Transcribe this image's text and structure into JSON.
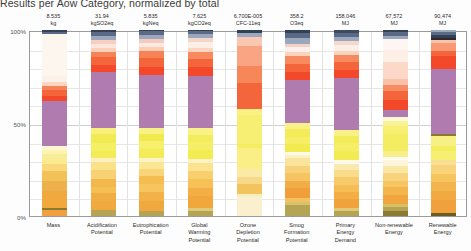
{
  "caption": "Results per Aow Category, normalized by total",
  "axis": {
    "y_ticks": [
      "100%",
      "50%",
      "0%"
    ],
    "y_values": [
      100,
      50,
      0
    ]
  },
  "chart_data": {
    "type": "bar",
    "subtype": "stacked-100-percent",
    "title": "Results per Aow Category, normalized by total",
    "xlabel": "",
    "ylabel": "",
    "ylim": [
      0,
      100
    ],
    "grid": true,
    "legend": "none",
    "categories": [
      "Mass",
      "Acidification Potential",
      "Eutrophication Potential",
      "Global Warming Potential",
      "Ozone Depletion Potential",
      "Smog Formation Potential",
      "Primary Energy Demand",
      "Non-renewable Energy",
      "Renewable Energy"
    ],
    "category_totals": [
      {
        "value": "8.535",
        "unit": "kg"
      },
      {
        "value": "31.94",
        "unit": "kgSO2eq"
      },
      {
        "value": "5.835",
        "unit": "kgNeq"
      },
      {
        "value": "7.625",
        "unit": "kgCO2eq"
      },
      {
        "value": "6.700E-005",
        "unit": "CFC-11eq"
      },
      {
        "value": "358.2",
        "unit": "O3eq"
      },
      {
        "value": "158,046",
        "unit": "MJ"
      },
      {
        "value": "67,572",
        "unit": "MJ"
      },
      {
        "value": "90,474",
        "unit": "MJ"
      }
    ],
    "stacks": [
      {
        "category": "Mass",
        "segments": [
          {
            "color": "#f0a03c",
            "pct": 3.0
          },
          {
            "color": "#8c7a33",
            "pct": 1.4
          },
          {
            "color": "#f3a83e",
            "pct": 4.0
          },
          {
            "color": "#f0a93f",
            "pct": 5.0
          },
          {
            "color": "#eeb04a",
            "pct": 5.5
          },
          {
            "color": "#f2c158",
            "pct": 5.0
          },
          {
            "color": "#f7d87a",
            "pct": 4.0
          },
          {
            "color": "#fbe98f",
            "pct": 2.0
          },
          {
            "color": "#f9ec96",
            "pct": 3.0
          },
          {
            "color": "#fdf3b2",
            "pct": 2.5
          },
          {
            "color": "#fdf7d0",
            "pct": 2.0
          },
          {
            "color": "#b07cb0",
            "pct": 24.0
          },
          {
            "color": "#f4482a",
            "pct": 2.4
          },
          {
            "color": "#f5653c",
            "pct": 3.6
          },
          {
            "color": "#f68355",
            "pct": 1.8
          },
          {
            "color": "#fbd7c3",
            "pct": 2.0
          },
          {
            "color": "#fdf0e6",
            "pct": 3.2
          },
          {
            "color": "#fdf6ef",
            "pct": 22.6
          },
          {
            "color": "#5a6a86",
            "pct": 1.0
          },
          {
            "color": "#334055",
            "pct": 1.0
          }
        ]
      },
      {
        "category": "Acidification Potential",
        "segments": [
          {
            "color": "#b5a453",
            "pct": 3.0
          },
          {
            "color": "#efa93e",
            "pct": 5.0
          },
          {
            "color": "#f0ad44",
            "pct": 4.0
          },
          {
            "color": "#f5bf52",
            "pct": 3.0
          },
          {
            "color": "#f3b84d",
            "pct": 4.5
          },
          {
            "color": "#f8d172",
            "pct": 4.5
          },
          {
            "color": "#fae18a",
            "pct": 4.0
          },
          {
            "color": "#fdf0c0",
            "pct": 2.0
          },
          {
            "color": "#f3ec56",
            "pct": 4.0
          },
          {
            "color": "#f5ef64",
            "pct": 4.0
          },
          {
            "color": "#f2ea52",
            "pct": 4.5
          },
          {
            "color": "#f7f07a",
            "pct": 3.5
          },
          {
            "color": "#b07cb0",
            "pct": 29.0
          },
          {
            "color": "#f4482a",
            "pct": 3.5
          },
          {
            "color": "#f5653c",
            "pct": 4.0
          },
          {
            "color": "#f68355",
            "pct": 3.0
          },
          {
            "color": "#fbd0bb",
            "pct": 2.0
          },
          {
            "color": "#fde7dd",
            "pct": 2.2
          },
          {
            "color": "#f6cfc2",
            "pct": 2.0
          },
          {
            "color": "#9aa7bd",
            "pct": 1.8
          },
          {
            "color": "#5a6a86",
            "pct": 2.2
          },
          {
            "color": "#334055",
            "pct": 1.0
          }
        ]
      },
      {
        "category": "Eutrophication Potential",
        "segments": [
          {
            "color": "#b5a453",
            "pct": 2.5
          },
          {
            "color": "#efa93e",
            "pct": 5.5
          },
          {
            "color": "#f2b247",
            "pct": 4.5
          },
          {
            "color": "#f6c55d",
            "pct": 4.0
          },
          {
            "color": "#f5bd50",
            "pct": 4.0
          },
          {
            "color": "#f9d478",
            "pct": 4.0
          },
          {
            "color": "#fbe693",
            "pct": 3.5
          },
          {
            "color": "#fdf3c8",
            "pct": 2.0
          },
          {
            "color": "#f3ec56",
            "pct": 4.5
          },
          {
            "color": "#f6f06c",
            "pct": 4.0
          },
          {
            "color": "#f1e94e",
            "pct": 4.0
          },
          {
            "color": "#f8f184",
            "pct": 3.0
          },
          {
            "color": "#b07cb0",
            "pct": 27.5
          },
          {
            "color": "#f4482a",
            "pct": 4.0
          },
          {
            "color": "#f5653c",
            "pct": 4.5
          },
          {
            "color": "#f68355",
            "pct": 3.5
          },
          {
            "color": "#fbcdb6",
            "pct": 2.2
          },
          {
            "color": "#fde9df",
            "pct": 2.3
          },
          {
            "color": "#f3cabc",
            "pct": 2.0
          },
          {
            "color": "#9aa7bd",
            "pct": 2.0
          },
          {
            "color": "#5a6a86",
            "pct": 2.0
          },
          {
            "color": "#334055",
            "pct": 0.5
          }
        ]
      },
      {
        "category": "Global Warming Potential",
        "segments": [
          {
            "color": "#b5a453",
            "pct": 2.5
          },
          {
            "color": "#dfc97a",
            "pct": 1.5
          },
          {
            "color": "#f2a73d",
            "pct": 6.0
          },
          {
            "color": "#f3ae45",
            "pct": 4.0
          },
          {
            "color": "#f6c258",
            "pct": 4.5
          },
          {
            "color": "#f8cf6d",
            "pct": 4.0
          },
          {
            "color": "#fbe391",
            "pct": 4.0
          },
          {
            "color": "#fdf2c6",
            "pct": 2.0
          },
          {
            "color": "#f2eb52",
            "pct": 4.5
          },
          {
            "color": "#f5ef68",
            "pct": 4.0
          },
          {
            "color": "#f3ec5c",
            "pct": 4.0
          },
          {
            "color": "#f8f288",
            "pct": 3.5
          },
          {
            "color": "#b07cb0",
            "pct": 26.0
          },
          {
            "color": "#f4482a",
            "pct": 4.5
          },
          {
            "color": "#f5653c",
            "pct": 4.0
          },
          {
            "color": "#f78a5e",
            "pct": 3.5
          },
          {
            "color": "#fbd5c2",
            "pct": 2.0
          },
          {
            "color": "#fdeee7",
            "pct": 3.0
          },
          {
            "color": "#f1d6cc",
            "pct": 2.0
          },
          {
            "color": "#9aa7bd",
            "pct": 2.0
          },
          {
            "color": "#5a6a86",
            "pct": 1.5
          },
          {
            "color": "#334055",
            "pct": 0.5
          }
        ]
      },
      {
        "category": "Ozone Depletion Potential",
        "segments": [
          {
            "color": "#fbf0cd",
            "pct": 10.0
          },
          {
            "color": "#f6f0c0",
            "pct": 2.0
          },
          {
            "color": "#f3c35e",
            "pct": 5.0
          },
          {
            "color": "#f8d98a",
            "pct": 4.0
          },
          {
            "color": "#fbe9a8",
            "pct": 4.5
          },
          {
            "color": "#f9ef86",
            "pct": 11.0
          },
          {
            "color": "#f5ec62",
            "pct": 2.0
          },
          {
            "color": "#f7ee74",
            "pct": 16.0
          },
          {
            "color": "#f9f184",
            "pct": 3.0
          },
          {
            "color": "#f5653c",
            "pct": 14.0
          },
          {
            "color": "#f78659",
            "pct": 9.0
          },
          {
            "color": "#f9a483",
            "pct": 11.0
          },
          {
            "color": "#fac7b2",
            "pct": 5.0
          },
          {
            "color": "#9aa7bd",
            "pct": 2.0
          },
          {
            "color": "#334055",
            "pct": 1.5
          }
        ]
      },
      {
        "category": "Smog Formation Potential",
        "segments": [
          {
            "color": "#b5a453",
            "pct": 6.0
          },
          {
            "color": "#d8c169",
            "pct": 1.5
          },
          {
            "color": "#f3c164",
            "pct": 2.0
          },
          {
            "color": "#f09f3a",
            "pct": 5.5
          },
          {
            "color": "#f2ae46",
            "pct": 4.0
          },
          {
            "color": "#f6c463",
            "pct": 4.0
          },
          {
            "color": "#f8d27a",
            "pct": 4.0
          },
          {
            "color": "#fae49c",
            "pct": 4.0
          },
          {
            "color": "#fcf0c6",
            "pct": 2.0
          },
          {
            "color": "#fefaea",
            "pct": 1.5
          },
          {
            "color": "#f2eb50",
            "pct": 4.0
          },
          {
            "color": "#f5ee66",
            "pct": 4.0
          },
          {
            "color": "#f3ec58",
            "pct": 4.5
          },
          {
            "color": "#f8f188",
            "pct": 3.0
          },
          {
            "color": "#b07cb0",
            "pct": 23.0
          },
          {
            "color": "#f4482a",
            "pct": 4.5
          },
          {
            "color": "#f5653c",
            "pct": 4.5
          },
          {
            "color": "#f78a5e",
            "pct": 4.0
          },
          {
            "color": "#fbd4c0",
            "pct": 2.0
          },
          {
            "color": "#fdf0e9",
            "pct": 3.0
          },
          {
            "color": "#f0d2c8",
            "pct": 1.5
          },
          {
            "color": "#9aa7bd",
            "pct": 3.0
          },
          {
            "color": "#5a6a86",
            "pct": 3.0
          },
          {
            "color": "#334055",
            "pct": 1.5
          }
        ]
      },
      {
        "category": "Primary Energy Demand",
        "segments": [
          {
            "color": "#b5a453",
            "pct": 2.5
          },
          {
            "color": "#e0c978",
            "pct": 1.5
          },
          {
            "color": "#f2a23b",
            "pct": 5.0
          },
          {
            "color": "#f3ae46",
            "pct": 3.5
          },
          {
            "color": "#f5bd54",
            "pct": 3.5
          },
          {
            "color": "#f7cb6b",
            "pct": 4.0
          },
          {
            "color": "#f9dd8b",
            "pct": 4.0
          },
          {
            "color": "#fbeab0",
            "pct": 3.0
          },
          {
            "color": "#fefae8",
            "pct": 2.0
          },
          {
            "color": "#f2eb52",
            "pct": 4.5
          },
          {
            "color": "#f5ee66",
            "pct": 4.0
          },
          {
            "color": "#f3ec5a",
            "pct": 4.0
          },
          {
            "color": "#f8f186",
            "pct": 3.0
          },
          {
            "color": "#b07cb0",
            "pct": 26.5
          },
          {
            "color": "#f4482a",
            "pct": 4.5
          },
          {
            "color": "#f5653c",
            "pct": 4.0
          },
          {
            "color": "#f78a5e",
            "pct": 3.5
          },
          {
            "color": "#fbd4c0",
            "pct": 2.0
          },
          {
            "color": "#fdeee7",
            "pct": 3.5
          },
          {
            "color": "#f6d9ce",
            "pct": 2.0
          },
          {
            "color": "#9aa7bd",
            "pct": 2.0
          },
          {
            "color": "#5a6a86",
            "pct": 2.0
          },
          {
            "color": "#3d4a60",
            "pct": 1.5
          }
        ]
      },
      {
        "category": "Non-renewable Energy",
        "segments": [
          {
            "color": "#8c7a33",
            "pct": 2.5
          },
          {
            "color": "#b5a453",
            "pct": 2.0
          },
          {
            "color": "#d9bf63",
            "pct": 2.0
          },
          {
            "color": "#f0a53e",
            "pct": 4.5
          },
          {
            "color": "#f3b54c",
            "pct": 4.0
          },
          {
            "color": "#f6c662",
            "pct": 3.5
          },
          {
            "color": "#f8d27c",
            "pct": 4.0
          },
          {
            "color": "#fae7a4",
            "pct": 3.5
          },
          {
            "color": "#fdf6dc",
            "pct": 3.0
          },
          {
            "color": "#fefbf0",
            "pct": 2.0
          },
          {
            "color": "#f7f08a",
            "pct": 3.0
          },
          {
            "color": "#f4ed62",
            "pct": 9.0
          },
          {
            "color": "#f6ef74",
            "pct": 4.0
          },
          {
            "color": "#f9f296",
            "pct": 2.5
          },
          {
            "color": "#fdfad8",
            "pct": 2.0
          },
          {
            "color": "#b07cb0",
            "pct": 4.0
          },
          {
            "color": "#f4482a",
            "pct": 5.0
          },
          {
            "color": "#f5653c",
            "pct": 5.0
          },
          {
            "color": "#f78d62",
            "pct": 3.0
          },
          {
            "color": "#fac0a8",
            "pct": 3.0
          },
          {
            "color": "#fbd8c8",
            "pct": 9.0
          },
          {
            "color": "#fdeee6",
            "pct": 6.0
          },
          {
            "color": "#fdf6f2",
            "pct": 6.0
          },
          {
            "color": "#9aa7bd",
            "pct": 1.5
          },
          {
            "color": "#5a6a86",
            "pct": 2.0
          },
          {
            "color": "#334055",
            "pct": 1.0
          }
        ]
      },
      {
        "category": "Renewable Energy",
        "segments": [
          {
            "color": "#6b5c22",
            "pct": 1.5
          },
          {
            "color": "#f0a03c",
            "pct": 6.5
          },
          {
            "color": "#f2a942",
            "pct": 4.0
          },
          {
            "color": "#f4b54e",
            "pct": 4.5
          },
          {
            "color": "#f6c55e",
            "pct": 4.0
          },
          {
            "color": "#f8d37a",
            "pct": 4.5
          },
          {
            "color": "#fae094",
            "pct": 2.5
          },
          {
            "color": "#f6ef72",
            "pct": 4.5
          },
          {
            "color": "#f3ec5c",
            "pct": 2.5
          },
          {
            "color": "#f7f084",
            "pct": 4.5
          },
          {
            "color": "#8c7a33",
            "pct": 1.0
          },
          {
            "color": "#b07cb0",
            "pct": 32.0
          },
          {
            "color": "#f4482a",
            "pct": 6.5
          },
          {
            "color": "#f5653c",
            "pct": 2.5
          },
          {
            "color": "#f79a74",
            "pct": 3.5
          },
          {
            "color": "#fbc3ae",
            "pct": 1.5
          },
          {
            "color": "#2b2b2b",
            "pct": 1.0
          },
          {
            "color": "#334055",
            "pct": 1.5
          },
          {
            "color": "#5a6a86",
            "pct": 1.5
          },
          {
            "color": "#9aa7bd",
            "pct": 1.0
          }
        ]
      }
    ]
  }
}
